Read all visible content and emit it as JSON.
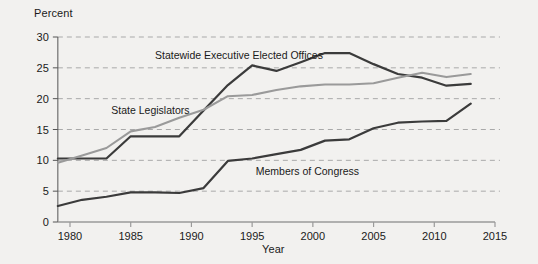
{
  "chart_data": {
    "type": "line",
    "title": "",
    "xlabel": "Year",
    "ylabel": "Percent",
    "xlim": [
      1979,
      2015
    ],
    "ylim": [
      0,
      30
    ],
    "xticks": [
      1980,
      1985,
      1990,
      1995,
      2000,
      2005,
      2010,
      2015
    ],
    "yticks": [
      0,
      5,
      10,
      15,
      20,
      25,
      30
    ],
    "grid": "horizontal-dashed",
    "legend": "inline-annotations",
    "series": [
      {
        "name": "Statewide Executive Elected Offices",
        "color": "#3b3b3b",
        "label_x": 1987.0,
        "label_y": 27.1,
        "x": [
          1979,
          1981,
          1983,
          1985,
          1987,
          1989,
          1991,
          1993,
          1995,
          1997,
          1999,
          2001,
          2003,
          2005,
          2007,
          2009,
          2011,
          2013
        ],
        "values": [
          10.3,
          10.3,
          10.3,
          13.9,
          13.9,
          13.9,
          18.1,
          22.2,
          25.4,
          24.5,
          25.9,
          27.4,
          27.4,
          25.6,
          24.0,
          23.4,
          22.1,
          22.4
        ]
      },
      {
        "name": "State Legislators",
        "color": "#9a9a9a",
        "label_x": 1983.4,
        "label_y": 18.2,
        "x": [
          1979,
          1981,
          1983,
          1985,
          1987,
          1989,
          1991,
          1993,
          1995,
          1997,
          1999,
          2001,
          2003,
          2005,
          2007,
          2009,
          2011,
          2013
        ],
        "values": [
          9.6,
          10.8,
          12.0,
          14.7,
          15.4,
          16.9,
          18.2,
          20.4,
          20.6,
          21.4,
          22.0,
          22.3,
          22.3,
          22.5,
          23.4,
          24.2,
          23.5,
          24.0
        ]
      },
      {
        "name": "Members of Congress",
        "color": "#3b3b3b",
        "label_x": 1995.3,
        "label_y": 8.3,
        "x": [
          1979,
          1981,
          1983,
          1985,
          1987,
          1989,
          1991,
          1993,
          1995,
          1997,
          1999,
          2001,
          2003,
          2005,
          2007,
          2009,
          2011,
          2013
        ],
        "values": [
          2.6,
          3.6,
          4.1,
          4.8,
          4.8,
          4.7,
          5.5,
          9.9,
          10.3,
          11.0,
          11.7,
          13.2,
          13.4,
          15.2,
          16.1,
          16.3,
          16.4,
          19.2
        ]
      }
    ]
  },
  "axis": {
    "y_title": "Percent",
    "x_title": "Year"
  }
}
